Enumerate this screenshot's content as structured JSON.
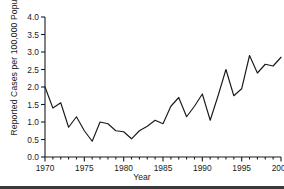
{
  "chart_data": {
    "type": "line",
    "title": "",
    "xlabel": "Year",
    "ylabel": "Reported Cases per 100,000 Population",
    "xlim": [
      1970,
      2000
    ],
    "ylim": [
      0.0,
      4.0
    ],
    "grid": false,
    "legend": null,
    "x_major_ticks": [
      1970,
      1975,
      1980,
      1985,
      1990,
      1995,
      2000
    ],
    "x_tick_labels": [
      "1970",
      "1975",
      "1980",
      "1985",
      "1990",
      "1995",
      "2000"
    ],
    "x_minor_tick_step": 1,
    "y_major_ticks": [
      0.0,
      0.5,
      1.0,
      1.5,
      2.0,
      2.5,
      3.0,
      3.5,
      4.0
    ],
    "y_tick_labels": [
      "0.0",
      "0.5",
      "1.0",
      "1.5",
      "2.0",
      "2.5",
      "3.0",
      "3.5",
      "4.0"
    ],
    "line_color": "#1a1a1a",
    "x": [
      1970,
      1971,
      1972,
      1973,
      1974,
      1975,
      1976,
      1977,
      1978,
      1979,
      1980,
      1981,
      1982,
      1983,
      1984,
      1985,
      1986,
      1987,
      1988,
      1989,
      1990,
      1991,
      1992,
      1993,
      1994,
      1995,
      1996,
      1997,
      1998,
      1999,
      2000
    ],
    "values": [
      2.0,
      1.4,
      1.55,
      0.85,
      1.15,
      0.75,
      0.45,
      1.0,
      0.95,
      0.75,
      0.72,
      0.52,
      0.75,
      0.88,
      1.05,
      0.95,
      1.45,
      1.7,
      1.15,
      1.45,
      1.8,
      1.05,
      1.75,
      2.5,
      1.75,
      1.95,
      2.9,
      2.4,
      2.65,
      2.6,
      2.85
    ]
  },
  "axes": {
    "y_axis_label": "Reported Cases per 100,000 Population",
    "x_axis_label": "Year"
  }
}
